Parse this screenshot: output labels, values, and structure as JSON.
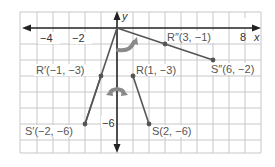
{
  "diagram": {
    "type": "coordinate-plane-transformation",
    "axes": {
      "x_label": "x",
      "y_label": "y",
      "x_ticks": [
        {
          "value": -4,
          "label": "−4"
        },
        {
          "value": -2,
          "label": "−2"
        },
        {
          "value": 8,
          "label": "8"
        }
      ],
      "y_ticks": [
        {
          "value": -6,
          "label": "−6"
        }
      ],
      "x_range": [
        -6,
        9
      ],
      "y_range": [
        -8,
        1
      ]
    },
    "segments": [
      {
        "name": "RS",
        "from": "R",
        "to": "S"
      },
      {
        "name": "R'S'",
        "from": "R'",
        "to": "S'"
      },
      {
        "name": "R''S''",
        "from": "R''",
        "to": "S''"
      }
    ],
    "points": {
      "R": {
        "label": "R(1, −3)",
        "x": 1,
        "y": -3
      },
      "S": {
        "label": "S(2, −6)",
        "x": 2,
        "y": -6
      },
      "R'": {
        "label": "R′(−1, −3)",
        "x": -1,
        "y": -3
      },
      "S'": {
        "label": "S′(−2, −6)",
        "x": -2,
        "y": -6
      },
      "R''": {
        "label": "R″(3, −1)",
        "x": 3,
        "y": -1
      },
      "S''": {
        "label": "S″(6, −2)",
        "x": 6,
        "y": -2
      }
    },
    "arrows": [
      {
        "name": "reflection-arrow",
        "description": "double-headed curved arrow across y-axis"
      },
      {
        "name": "rotation-arrow",
        "description": "curved arrow rotating toward upper right"
      }
    ],
    "colors": {
      "grid": "#c8c8c8",
      "axis": "#222222",
      "segment": "#555555",
      "arrow": "#8a8a8a",
      "label": "#555555"
    }
  }
}
